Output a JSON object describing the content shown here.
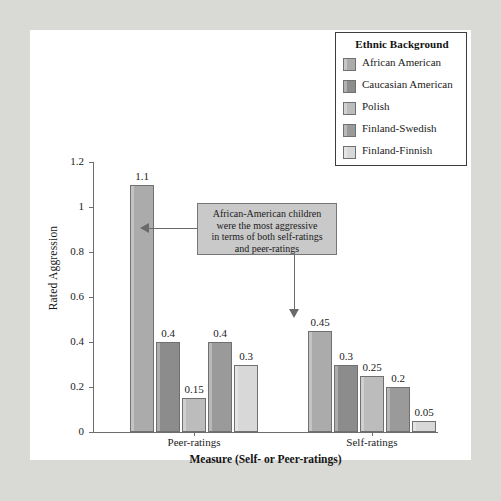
{
  "chart_data": {
    "type": "bar",
    "title": "",
    "xlabel": "Measure (Self- or Peer-ratings)",
    "ylabel": "Rated Aggression",
    "categories": [
      "Peer-ratings",
      "Self-ratings"
    ],
    "ylim": [
      0,
      1.2
    ],
    "yticks": [
      "0",
      "0.2",
      "0.4",
      "0.6",
      "0.8",
      "1",
      "1.2"
    ],
    "ytick_values": [
      0,
      0.2,
      0.4,
      0.6,
      0.8,
      1.0,
      1.2
    ],
    "grid": false,
    "legend_position": "top-right",
    "series": [
      {
        "name": "African American",
        "color": "#ababab",
        "values": [
          1.1,
          0.45
        ],
        "labels": [
          "1.1",
          "0.45"
        ]
      },
      {
        "name": "Caucasian American",
        "color": "#8c8c8c",
        "values": [
          0.4,
          0.3
        ],
        "labels": [
          "0.4",
          "0.3"
        ]
      },
      {
        "name": "Polish",
        "color": "#bcbcbc",
        "values": [
          0.15,
          0.25
        ],
        "labels": [
          "0.15",
          "0.25"
        ]
      },
      {
        "name": "Finland-Swedish",
        "color": "#9a9a9a",
        "values": [
          0.4,
          0.2
        ],
        "labels": [
          "0.4",
          "0.2"
        ]
      },
      {
        "name": "Finland-Finnish",
        "color": "#d8d8d8",
        "values": [
          0.3,
          0.05
        ],
        "labels": [
          "0.3",
          "0.05"
        ]
      }
    ]
  },
  "legend": {
    "title": "Ethnic Background",
    "items": [
      {
        "label": "African American"
      },
      {
        "label": "Caucasian American"
      },
      {
        "label": "Polish"
      },
      {
        "label": "Finland-Swedish"
      },
      {
        "label": "Finland-Finnish"
      }
    ]
  },
  "annotation": {
    "text": "African-American children\nwere the most aggressive\nin terms of both self-ratings\nand peer-ratings"
  },
  "colors": {
    "axis": "#6d6d6d",
    "text": "#1b1b1b",
    "callout_fill": "#c9c9c9",
    "callout_border": "#767676",
    "page_background": "#d9d9d6",
    "panel_background": "#ffffff"
  }
}
